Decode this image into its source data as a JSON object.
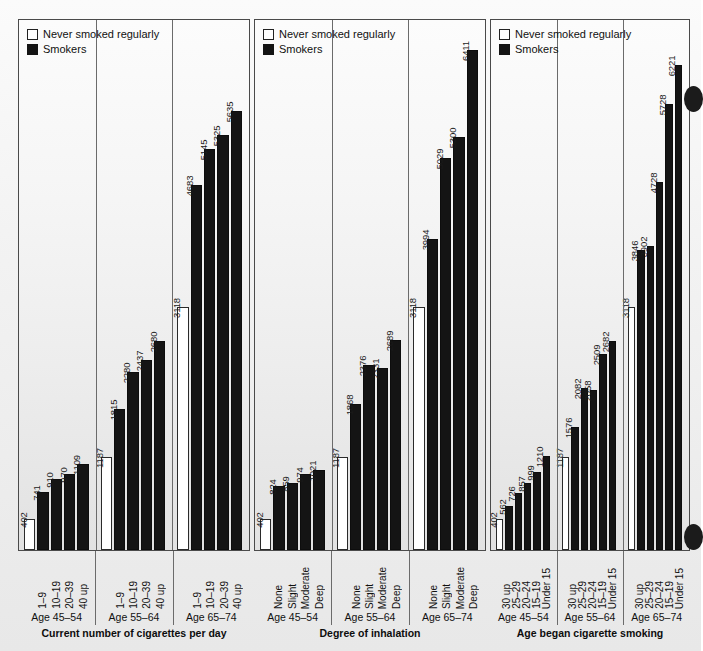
{
  "legend": {
    "items": [
      {
        "key": "never",
        "label": "Never smoked regularly"
      },
      {
        "key": "smokers",
        "label": "Smokers"
      }
    ]
  },
  "axis_max": 6800,
  "chart_data": [
    {
      "type": "bar",
      "title": "Current number of cigarettes per day",
      "xlabel": "Current number of cigarettes per day",
      "ylabel": "",
      "ylim": [
        0,
        6800
      ],
      "grid": false,
      "legend_position": "top-left",
      "legend": [
        "Never smoked regularly",
        "Smokers"
      ],
      "groups": [
        {
          "group_label": "Age 45–54",
          "categories": [
            "",
            "1–9",
            "10–19",
            "20–39",
            "40 up"
          ],
          "series_key": [
            "never",
            "smoker",
            "smoker",
            "smoker",
            "smoker"
          ],
          "values": [
            402,
            741,
            910,
            970,
            1109
          ]
        },
        {
          "group_label": "Age 55–64",
          "categories": [
            "",
            "1–9",
            "10–19",
            "20–39",
            "40 up"
          ],
          "series_key": [
            "never",
            "smoker",
            "smoker",
            "smoker",
            "smoker"
          ],
          "values": [
            1187,
            1815,
            2280,
            2437,
            2680
          ]
        },
        {
          "group_label": "Age 65–74",
          "categories": [
            "",
            "1–9",
            "10–19",
            "20–39",
            "40 up"
          ],
          "series_key": [
            "never",
            "smoker",
            "smoker",
            "smoker",
            "smoker"
          ],
          "values": [
            3118,
            4683,
            5145,
            5325,
            5635
          ]
        }
      ]
    },
    {
      "type": "bar",
      "title": "Degree of inhalation",
      "xlabel": "Degree of inhalation",
      "ylabel": "",
      "ylim": [
        0,
        6800
      ],
      "grid": false,
      "legend_position": "top-left",
      "legend": [
        "Never smoked regularly",
        "Smokers"
      ],
      "groups": [
        {
          "group_label": "Age 45–54",
          "categories": [
            "",
            "None",
            "Slight",
            "Moderate",
            "Deep"
          ],
          "series_key": [
            "never",
            "smoker",
            "smoker",
            "smoker",
            "smoker"
          ],
          "values": [
            402,
            824,
            859,
            974,
            1021
          ]
        },
        {
          "group_label": "Age 55–64",
          "categories": [
            "",
            "None",
            "Slight",
            "Moderate",
            "Deep"
          ],
          "series_key": [
            "never",
            "smoker",
            "smoker",
            "smoker",
            "smoker"
          ],
          "values": [
            1187,
            1868,
            2376,
            2331,
            2689
          ]
        },
        {
          "group_label": "Age 65–74",
          "categories": [
            "",
            "None",
            "Slight",
            "Moderate",
            "Deep"
          ],
          "series_key": [
            "never",
            "smoker",
            "smoker",
            "smoker",
            "smoker"
          ],
          "values": [
            3118,
            3994,
            5029,
            5300,
            6411
          ]
        }
      ]
    },
    {
      "type": "bar",
      "title": "Age began cigarette smoking",
      "xlabel": "Age began cigarette smoking",
      "ylabel": "",
      "ylim": [
        0,
        6800
      ],
      "grid": false,
      "legend_position": "top-left",
      "legend": [
        "Never smoked regularly",
        "Smokers"
      ],
      "groups": [
        {
          "group_label": "Age 45–54",
          "categories": [
            "",
            "30 up",
            "25–29",
            "20–24",
            "15–19",
            "Under 15"
          ],
          "series_key": [
            "never",
            "smoker",
            "smoker",
            "smoker",
            "smoker",
            "smoker"
          ],
          "values": [
            402,
            562,
            726,
            857,
            999,
            1210
          ]
        },
        {
          "group_label": "Age 55–64",
          "categories": [
            "",
            "30 up",
            "25–29",
            "20–24",
            "15–19",
            "Under 15"
          ],
          "series_key": [
            "never",
            "smoker",
            "smoker",
            "smoker",
            "smoker",
            "smoker"
          ],
          "values": [
            1187,
            1576,
            2082,
            2058,
            2509,
            2682
          ]
        },
        {
          "group_label": "Age 65–74",
          "categories": [
            "",
            "30 up",
            "25–29",
            "20–24",
            "15–19",
            "Under 15"
          ],
          "series_key": [
            "never",
            "smoker",
            "smoker",
            "smoker",
            "smoker",
            "smoker"
          ],
          "values": [
            3118,
            3846,
            3902,
            4728,
            5728,
            6221
          ]
        }
      ]
    }
  ],
  "page_marks": {
    "binder_hole_top": "binder-hole",
    "binder_hole_bottom": "binder-hole"
  }
}
